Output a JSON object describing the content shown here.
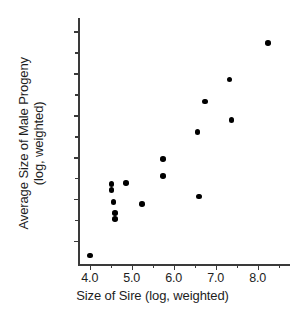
{
  "chart_data": {
    "type": "scatter",
    "title": "",
    "xlabel": "Size of Sire (log, weighted)",
    "ylabel_line1": "Average Size of Male Progeny",
    "ylabel_line2": "(log, weighted)",
    "xlim": [
      3.72,
      8.77
    ],
    "ylim": [
      3.45,
      9.32
    ],
    "xticks": [
      4.0,
      5.0,
      6.0,
      7.0,
      8.0
    ],
    "xtick_labels": [
      "4.0",
      "5.0",
      "6.0",
      "7.0",
      "8.0"
    ],
    "xticks_minor": [
      4.5,
      5.5,
      6.5,
      7.5,
      8.5
    ],
    "yticks": [
      4.0,
      5.0,
      6.0,
      7.0,
      8.0,
      9.0
    ],
    "ytick_labels": [
      "4.0",
      "5.0",
      "6.0",
      "7.0",
      "8.0",
      "9.0"
    ],
    "yticks_minor": [
      4.5,
      5.5,
      6.5,
      7.5,
      8.5
    ],
    "grid": false,
    "legend": false,
    "marker": "filled-circle",
    "marker_color": "#000000",
    "axis_color": "#3a3a3a",
    "points": [
      {
        "x": 4.0,
        "y": 3.65
      },
      {
        "x": 4.52,
        "y": 5.36
      },
      {
        "x": 4.52,
        "y": 5.22
      },
      {
        "x": 4.86,
        "y": 5.38
      },
      {
        "x": 4.57,
        "y": 4.93
      },
      {
        "x": 4.6,
        "y": 4.67
      },
      {
        "x": 4.6,
        "y": 4.52
      },
      {
        "x": 5.24,
        "y": 4.88
      },
      {
        "x": 5.74,
        "y": 5.95
      },
      {
        "x": 5.74,
        "y": 5.55
      },
      {
        "x": 6.6,
        "y": 5.06
      },
      {
        "x": 6.57,
        "y": 6.6
      },
      {
        "x": 6.74,
        "y": 7.33
      },
      {
        "x": 7.33,
        "y": 7.85
      },
      {
        "x": 7.38,
        "y": 6.88
      },
      {
        "x": 8.24,
        "y": 8.72
      }
    ]
  }
}
